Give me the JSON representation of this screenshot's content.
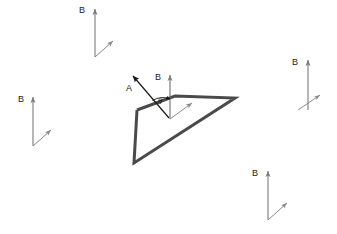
{
  "diagram": {
    "background_color": "#ffffff",
    "width": 337,
    "height": 234,
    "colors": {
      "field_vector": "#7a7a7a",
      "surface_edge": "#4a4a4a",
      "normal_vector": "#1a1a1a",
      "label_text": "#1a1a1a"
    },
    "field_vectors": [
      {
        "id": "field-top-left",
        "label": "B",
        "label_x": 79,
        "label_y": 13,
        "shaft_x": 95,
        "shaft_top_y": 9,
        "shaft_bottom_y": 57,
        "diag_from_x": 95,
        "diag_from_y": 57,
        "diag_to_x": 113,
        "diag_to_y": 41
      },
      {
        "id": "field-left",
        "label": "B",
        "label_x": 18,
        "label_y": 102,
        "shaft_x": 33,
        "shaft_top_y": 97,
        "shaft_bottom_y": 146,
        "diag_from_x": 33,
        "diag_from_y": 146,
        "diag_to_x": 51,
        "diag_to_y": 130
      },
      {
        "id": "field-right",
        "label": "B",
        "label_x": 292,
        "label_y": 65,
        "shaft_x": 308,
        "shaft_top_y": 60,
        "shaft_bottom_y": 110,
        "diag_from_x": 298,
        "diag_from_y": 110,
        "diag_to_x": 320,
        "diag_to_y": 95
      },
      {
        "id": "field-bottom-right",
        "label": "B",
        "label_x": 252,
        "label_y": 176,
        "shaft_x": 268,
        "shaft_top_y": 171,
        "shaft_bottom_y": 220,
        "diag_from_x": 268,
        "diag_from_y": 220,
        "diag_to_x": 287,
        "diag_to_y": 203
      },
      {
        "id": "field-center",
        "label": "B",
        "label_x": 155,
        "label_y": 80,
        "shaft_x": 170,
        "shaft_top_y": 75,
        "shaft_bottom_y": 119,
        "diag_from_x": 170,
        "diag_from_y": 119,
        "diag_to_x": 192,
        "diag_to_y": 103
      }
    ],
    "surface": {
      "id": "planar-surface",
      "stroke": "#4a4a4a",
      "stroke_width": 3,
      "points": "137,110 175,96 235,98 134,163 137,110"
    },
    "normal_vector": {
      "id": "normal-vector-a",
      "label": "A",
      "label_x": 126,
      "label_y": 91,
      "from_x": 169,
      "from_y": 118,
      "to_x": 133,
      "to_y": 76
    },
    "angle": {
      "id": "angle-theta",
      "label": "θ",
      "label_x": 159,
      "label_y": 105,
      "arc_path": "M 156,105 A 18,18 0 0 1 170,100"
    }
  }
}
